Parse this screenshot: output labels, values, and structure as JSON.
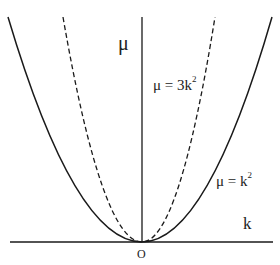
{
  "diagram": {
    "axes": {
      "vertical_label": "μ",
      "horizontal_label": "k",
      "origin_label": "O"
    },
    "curves": [
      {
        "name": "solid",
        "style": "solid",
        "label": "μ = k",
        "exponent": "2",
        "equation": "μ = k²"
      },
      {
        "name": "dashed",
        "style": "dashed",
        "label": "μ = 3k",
        "exponent": "2",
        "equation": "μ = 3k²"
      }
    ],
    "colors": {
      "line": "#1a1a1a",
      "background": "#ffffff"
    }
  }
}
